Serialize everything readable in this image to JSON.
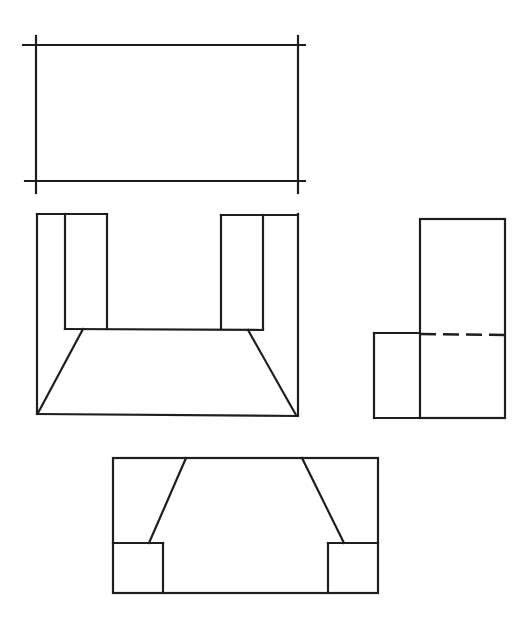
{
  "figure": {
    "type": "orthographic-projection",
    "stroke_color": "#1e1e1e",
    "background": "#ffffff",
    "views": [
      {
        "name": "top-view-blank",
        "description": "Rectangle with extended corner lines (view to be completed)"
      },
      {
        "name": "front-view",
        "description": "U-shaped outline with two upright blocks and tapered base"
      },
      {
        "name": "side-view",
        "description": "Tall rectangle with lower left step and hidden (dashed) line"
      },
      {
        "name": "bottom-view",
        "description": "Rectangle with two corner squares and two slanted edges"
      }
    ]
  }
}
